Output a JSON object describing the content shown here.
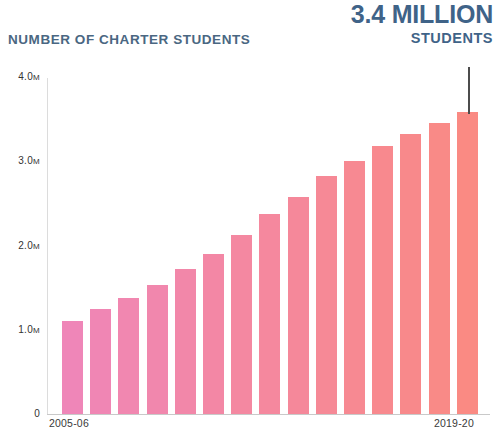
{
  "header": {
    "chart_title": "NUMBER OF CHARTER STUDENTS",
    "callout_value": "3.4 MILLION",
    "callout_unit": "STUDENTS"
  },
  "axis": {
    "y_ticks": [
      "4.0M",
      "3.0M",
      "2.0M",
      "1.0M",
      "0"
    ],
    "x_first": "2005-06",
    "x_last": "2019-20"
  },
  "colors": {
    "bar_start": "#ef86b8",
    "bar_end": "#fa8a83",
    "callout_text": "#3f6388",
    "title_text": "#4a6782",
    "axis_line": "#c9c9c9",
    "pointer_line": "#4c4c4c"
  },
  "chart_data": {
    "type": "bar",
    "title": "NUMBER OF CHARTER STUDENTS",
    "subtitle": "3.4 MILLION STUDENTS",
    "xlabel": "",
    "ylabel": "",
    "ylim": [
      0,
      4000000
    ],
    "grid": false,
    "legend": null,
    "annotation": "3.4 MILLION STUDENTS",
    "y_tick_values": [
      0,
      1000000,
      2000000,
      3000000,
      4000000
    ],
    "y_tick_labels": [
      "0",
      "1.0M",
      "2.0M",
      "3.0M",
      "4.0M"
    ],
    "categories": [
      "2005-06",
      "2006-07",
      "2007-08",
      "2008-09",
      "2009-10",
      "2010-11",
      "2011-12",
      "2012-13",
      "2013-14",
      "2014-15",
      "2015-16",
      "2016-17",
      "2017-18",
      "2018-19",
      "2019-20"
    ],
    "values": [
      1100000,
      1250000,
      1380000,
      1530000,
      1720000,
      1900000,
      2130000,
      2380000,
      2580000,
      2820000,
      3000000,
      3180000,
      3320000,
      3450000,
      3580000
    ],
    "value_labels": [
      "1.10M",
      "1.25M",
      "1.38M",
      "1.53M",
      "1.72M",
      "1.90M",
      "2.13M",
      "2.38M",
      "2.58M",
      "2.82M",
      "3.00M",
      "3.18M",
      "3.32M",
      "3.45M",
      "3.58M"
    ]
  }
}
